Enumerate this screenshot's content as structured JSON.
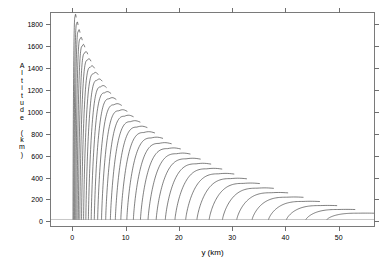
{
  "chart_data": {
    "type": "line",
    "title": "",
    "subtitle": "",
    "xlabel": "y (km)",
    "ylabel": "Altitude (km)",
    "xlim": [
      -4,
      57
    ],
    "ylim": [
      -60,
      1900
    ],
    "xticks": [
      0,
      10,
      20,
      30,
      40,
      50
    ],
    "xticklabels": [
      "0",
      "10",
      "20",
      "30",
      "40",
      "50"
    ],
    "yticks": [
      0,
      200,
      400,
      600,
      800,
      1000,
      1200,
      1400,
      1600,
      1800
    ],
    "yticklabels": [
      "0",
      "200",
      "400",
      "600",
      "800",
      "1000",
      "1200",
      "1400",
      "1600",
      "1800"
    ],
    "grid": false,
    "legend": false,
    "legend_position": "none",
    "line_color": "#2b2b2b",
    "line_width": 0.6,
    "frame_color": "#7a7a7a",
    "background": "#ffffff",
    "series": [
      {
        "name": "traj-01",
        "x_start": 0.1,
        "x_peak": 0.55,
        "y_peak": 1870
      },
      {
        "name": "traj-02",
        "x_start": 0.25,
        "x_peak": 0.85,
        "y_peak": 1800
      },
      {
        "name": "traj-03",
        "x_start": 0.4,
        "x_peak": 1.15,
        "y_peak": 1730
      },
      {
        "name": "traj-04",
        "x_start": 0.58,
        "x_peak": 1.5,
        "y_peak": 1660
      },
      {
        "name": "traj-05",
        "x_start": 0.78,
        "x_peak": 1.9,
        "y_peak": 1595
      },
      {
        "name": "traj-06",
        "x_start": 1.0,
        "x_peak": 2.35,
        "y_peak": 1530
      },
      {
        "name": "traj-07",
        "x_start": 1.25,
        "x_peak": 2.85,
        "y_peak": 1465
      },
      {
        "name": "traj-08",
        "x_start": 1.55,
        "x_peak": 3.4,
        "y_peak": 1400
      },
      {
        "name": "traj-09",
        "x_start": 1.9,
        "x_peak": 4.0,
        "y_peak": 1340
      },
      {
        "name": "traj-10",
        "x_start": 2.3,
        "x_peak": 4.65,
        "y_peak": 1280
      },
      {
        "name": "traj-11",
        "x_start": 2.75,
        "x_peak": 5.35,
        "y_peak": 1220
      },
      {
        "name": "traj-12",
        "x_start": 3.25,
        "x_peak": 6.1,
        "y_peak": 1165
      },
      {
        "name": "traj-13",
        "x_start": 3.8,
        "x_peak": 6.95,
        "y_peak": 1110
      },
      {
        "name": "traj-14",
        "x_start": 4.4,
        "x_peak": 7.85,
        "y_peak": 1055
      },
      {
        "name": "traj-15",
        "x_start": 5.1,
        "x_peak": 8.8,
        "y_peak": 1000
      },
      {
        "name": "traj-16",
        "x_start": 5.85,
        "x_peak": 9.85,
        "y_peak": 950
      },
      {
        "name": "traj-17",
        "x_start": 6.7,
        "x_peak": 11.0,
        "y_peak": 900
      },
      {
        "name": "traj-18",
        "x_start": 7.6,
        "x_peak": 12.2,
        "y_peak": 850
      },
      {
        "name": "traj-19",
        "x_start": 8.6,
        "x_peak": 13.5,
        "y_peak": 800
      },
      {
        "name": "traj-20",
        "x_start": 9.7,
        "x_peak": 14.9,
        "y_peak": 750
      },
      {
        "name": "traj-21",
        "x_start": 10.9,
        "x_peak": 16.4,
        "y_peak": 700
      },
      {
        "name": "traj-22",
        "x_start": 12.2,
        "x_peak": 18.0,
        "y_peak": 652
      },
      {
        "name": "traj-23",
        "x_start": 13.6,
        "x_peak": 19.7,
        "y_peak": 605
      },
      {
        "name": "traj-24",
        "x_start": 15.1,
        "x_peak": 21.5,
        "y_peak": 558
      },
      {
        "name": "traj-25",
        "x_start": 16.8,
        "x_peak": 23.4,
        "y_peak": 512
      },
      {
        "name": "traj-26",
        "x_start": 18.6,
        "x_peak": 25.4,
        "y_peak": 466
      },
      {
        "name": "traj-27",
        "x_start": 20.6,
        "x_peak": 27.6,
        "y_peak": 420
      },
      {
        "name": "traj-28",
        "x_start": 22.7,
        "x_peak": 29.9,
        "y_peak": 376
      },
      {
        "name": "traj-29",
        "x_start": 25.0,
        "x_peak": 32.3,
        "y_peak": 332
      },
      {
        "name": "traj-30",
        "x_start": 27.5,
        "x_peak": 34.9,
        "y_peak": 288
      },
      {
        "name": "traj-31",
        "x_start": 30.2,
        "x_peak": 37.6,
        "y_peak": 246
      },
      {
        "name": "traj-32",
        "x_start": 33.1,
        "x_peak": 40.5,
        "y_peak": 205
      },
      {
        "name": "traj-33",
        "x_start": 36.2,
        "x_peak": 43.6,
        "y_peak": 166
      },
      {
        "name": "traj-34",
        "x_start": 39.6,
        "x_peak": 46.9,
        "y_peak": 128
      },
      {
        "name": "traj-35",
        "x_start": 43.3,
        "x_peak": 50.4,
        "y_peak": 92
      },
      {
        "name": "traj-36",
        "x_start": 47.3,
        "x_peak": 54.1,
        "y_peak": 58
      }
    ]
  },
  "axis": {
    "x_title": "y (km)",
    "y_title_chars": [
      "A",
      "l",
      "t",
      "i",
      "t",
      "u",
      "d",
      "e",
      "",
      "(",
      "k",
      "m",
      ")"
    ]
  }
}
